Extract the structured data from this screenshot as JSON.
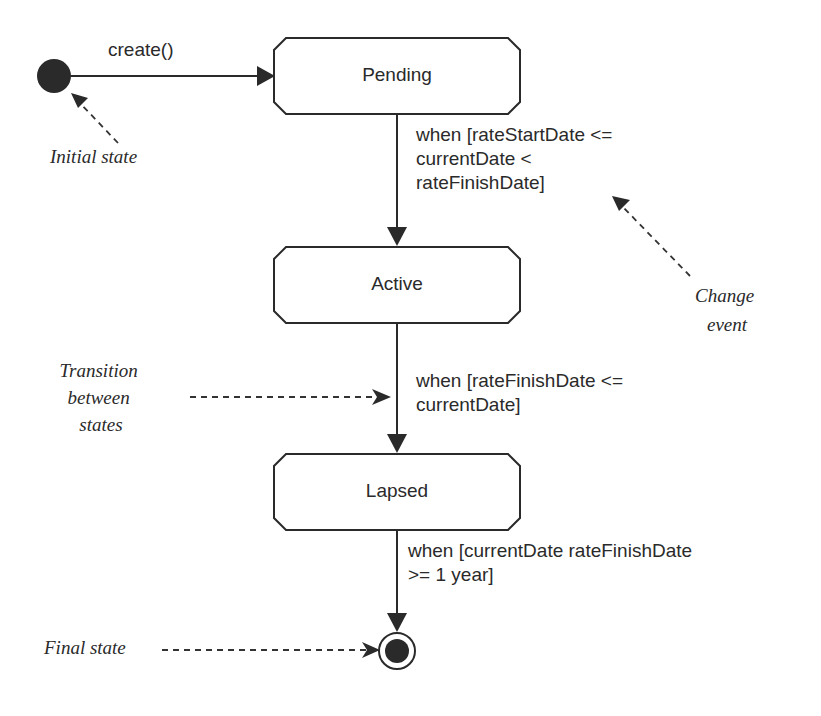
{
  "diagram": {
    "type": "UML state machine diagram",
    "colors": {
      "stroke": "#2a2a2a",
      "background": "#ffffff"
    },
    "initial_state": {
      "trigger_label": "create()",
      "annotation": "Initial state"
    },
    "states": [
      {
        "id": "pending",
        "label": "Pending"
      },
      {
        "id": "active",
        "label": "Active"
      },
      {
        "id": "lapsed",
        "label": "Lapsed"
      }
    ],
    "transitions": [
      {
        "from": "initial",
        "to": "pending",
        "label": "create()"
      },
      {
        "from": "pending",
        "to": "active",
        "label_lines": [
          "when [rateStartDate <=",
          "currentDate <",
          "rateFinishDate]"
        ]
      },
      {
        "from": "active",
        "to": "lapsed",
        "label_lines": [
          "when [rateFinishDate <=",
          "currentDate]"
        ]
      },
      {
        "from": "lapsed",
        "to": "final",
        "label_lines": [
          "when [currentDate  rateFinishDate",
          ">= 1 year]"
        ]
      }
    ],
    "annotations": {
      "initial_state": "Initial state",
      "change_event": [
        "Change",
        "event"
      ],
      "transition_between_states": [
        "Transition",
        "between",
        "states"
      ],
      "final_state": "Final state"
    }
  }
}
